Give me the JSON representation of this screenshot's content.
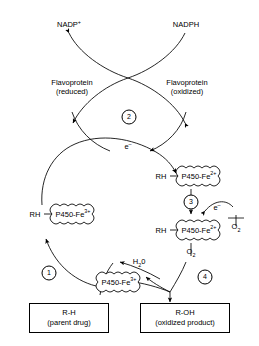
{
  "diagram": {
    "cofactors": {
      "nadp_oxidized": "NADP",
      "nadp_oxidized_charge": "+",
      "nadph": "NADPH"
    },
    "flavoprotein_reduced": {
      "name": "Flavoprotein",
      "state": "(reduced)"
    },
    "flavoprotein_oxidized": {
      "name": "Flavoprotein",
      "state": "(oxidized)"
    },
    "electron_label_top": "e",
    "electron_label_top_charge": "–",
    "electron_label_step3": "e",
    "electron_label_step3_charge": "–",
    "oxygen_upper": {
      "formula": "O",
      "sub": "2"
    },
    "oxygen_lower": {
      "formula": "O",
      "sub": "2"
    },
    "water": {
      "formula": "H",
      "sub": "2",
      "rest": "0"
    },
    "steps": [
      {
        "number": "1"
      },
      {
        "number": "2"
      },
      {
        "number": "3"
      },
      {
        "number": "4"
      }
    ],
    "complexes": [
      {
        "id": "free-p450-bottom",
        "substrate": "",
        "enzyme": "P450-Fe",
        "charge": "3+"
      },
      {
        "id": "rh-p450-fe3-left",
        "substrate": "RH",
        "enzyme": "P450-Fe",
        "charge": "3+"
      },
      {
        "id": "rh-p450-fe2-upper-right",
        "substrate": "RH",
        "enzyme": "P450-Fe",
        "charge": "2+"
      },
      {
        "id": "rh-p450-fe2-lower-right",
        "substrate": "RH",
        "enzyme": "P450-Fe",
        "charge": "2+"
      }
    ],
    "substrate_box": {
      "title": "R-H",
      "subtitle": "(parent drug)"
    },
    "product_box": {
      "title": "R-OH",
      "subtitle": "(oxidized product)"
    },
    "colors": {
      "stroke": "#000000",
      "background": "#ffffff"
    }
  }
}
